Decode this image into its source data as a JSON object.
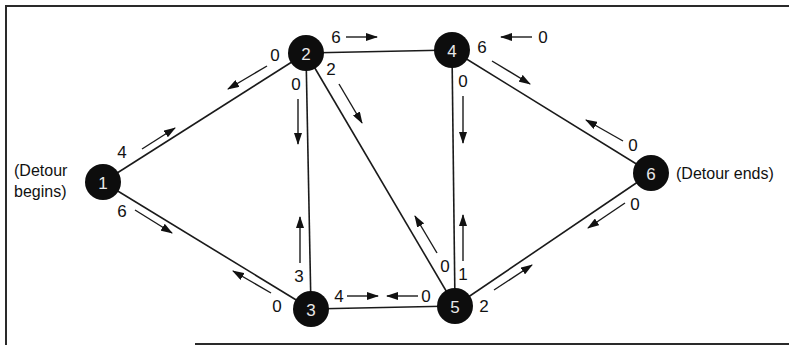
{
  "diagram": {
    "type": "network-flow",
    "annotations": {
      "start_line1": "(Detour",
      "start_line2": "begins)",
      "end": "(Detour ends)"
    },
    "nodes": [
      {
        "id": "1",
        "label": "1",
        "x": 103,
        "y": 182
      },
      {
        "id": "2",
        "label": "2",
        "x": 306,
        "y": 53
      },
      {
        "id": "3",
        "label": "3",
        "x": 311,
        "y": 309
      },
      {
        "id": "4",
        "label": "4",
        "x": 452,
        "y": 50
      },
      {
        "id": "5",
        "label": "5",
        "x": 455,
        "y": 306
      },
      {
        "id": "6",
        "label": "6",
        "x": 651,
        "y": 173
      }
    ],
    "edges": [
      {
        "from": "1",
        "to": "2",
        "capacity_forward": 4,
        "capacity_backward": 0
      },
      {
        "from": "1",
        "to": "3",
        "capacity_forward": 6,
        "capacity_backward": 0
      },
      {
        "from": "2",
        "to": "3",
        "capacity_forward": 0,
        "capacity_backward": 3
      },
      {
        "from": "2",
        "to": "4",
        "capacity_forward": 6,
        "capacity_backward": 0
      },
      {
        "from": "2",
        "to": "5",
        "capacity_forward": 2,
        "capacity_backward": 0
      },
      {
        "from": "3",
        "to": "5",
        "capacity_forward": 4,
        "capacity_backward": 0
      },
      {
        "from": "4",
        "to": "5",
        "capacity_forward": 0,
        "capacity_backward": 1
      },
      {
        "from": "4",
        "to": "6",
        "capacity_forward": 6,
        "capacity_backward": 0
      },
      {
        "from": "5",
        "to": "6",
        "capacity_forward": 2,
        "capacity_backward": 0
      }
    ],
    "capacity_labels": [
      {
        "text": "4",
        "x": 122,
        "y": 152
      },
      {
        "text": "0",
        "x": 275,
        "y": 55
      },
      {
        "text": "6",
        "x": 122,
        "y": 211
      },
      {
        "text": "0",
        "x": 277,
        "y": 306
      },
      {
        "text": "0",
        "x": 296,
        "y": 84
      },
      {
        "text": "3",
        "x": 299,
        "y": 276
      },
      {
        "text": "6",
        "x": 336,
        "y": 37
      },
      {
        "text": "0",
        "x": 543,
        "y": 37
      },
      {
        "text": "2",
        "x": 331,
        "y": 69
      },
      {
        "text": "0",
        "x": 445,
        "y": 266
      },
      {
        "text": "4",
        "x": 339,
        "y": 296
      },
      {
        "text": "0",
        "x": 426,
        "y": 296
      },
      {
        "text": "0",
        "x": 463,
        "y": 81
      },
      {
        "text": "1",
        "x": 463,
        "y": 274
      },
      {
        "text": "6",
        "x": 482,
        "y": 47
      },
      {
        "text": "0",
        "x": 633,
        "y": 145
      },
      {
        "text": "2",
        "x": 484,
        "y": 306
      },
      {
        "text": "0",
        "x": 635,
        "y": 204
      }
    ],
    "arrows": [
      {
        "x1": 142,
        "y1": 149,
        "x2": 175,
        "y2": 128
      },
      {
        "x1": 267,
        "y1": 66,
        "x2": 228,
        "y2": 89
      },
      {
        "x1": 135,
        "y1": 210,
        "x2": 172,
        "y2": 233
      },
      {
        "x1": 271,
        "y1": 293,
        "x2": 233,
        "y2": 271
      },
      {
        "x1": 298,
        "y1": 99,
        "x2": 298,
        "y2": 144
      },
      {
        "x1": 300,
        "y1": 263,
        "x2": 300,
        "y2": 217
      },
      {
        "x1": 346,
        "y1": 37,
        "x2": 377,
        "y2": 37
      },
      {
        "x1": 532,
        "y1": 37,
        "x2": 501,
        "y2": 37
      },
      {
        "x1": 339,
        "y1": 84,
        "x2": 362,
        "y2": 123
      },
      {
        "x1": 437,
        "y1": 253,
        "x2": 415,
        "y2": 216
      },
      {
        "x1": 347,
        "y1": 296,
        "x2": 378,
        "y2": 296
      },
      {
        "x1": 418,
        "y1": 296,
        "x2": 387,
        "y2": 296
      },
      {
        "x1": 463,
        "y1": 96,
        "x2": 463,
        "y2": 143
      },
      {
        "x1": 463,
        "y1": 261,
        "x2": 463,
        "y2": 215
      },
      {
        "x1": 492,
        "y1": 61,
        "x2": 530,
        "y2": 84
      },
      {
        "x1": 623,
        "y1": 141,
        "x2": 586,
        "y2": 120
      },
      {
        "x1": 494,
        "y1": 290,
        "x2": 532,
        "y2": 265
      },
      {
        "x1": 625,
        "y1": 203,
        "x2": 588,
        "y2": 228
      }
    ]
  }
}
